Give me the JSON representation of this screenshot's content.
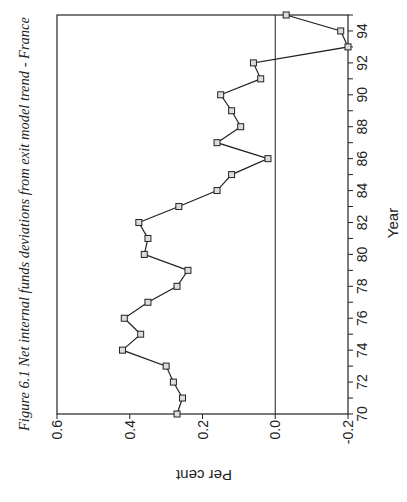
{
  "chart_data": {
    "type": "line",
    "title": "Figure 6.1 Net internal funds deviations from exit model trend - France",
    "xlabel": "Year",
    "ylabel": "Per cent",
    "orientation": "rotated 90° counter-clockwise on page",
    "x": [
      70,
      71,
      72,
      73,
      74,
      75,
      76,
      77,
      78,
      79,
      80,
      81,
      82,
      83,
      84,
      85,
      86,
      87,
      88,
      89,
      90,
      91,
      92,
      93,
      94,
      95
    ],
    "series": [
      {
        "name": "Net internal funds deviation",
        "marker": "square",
        "values": [
          0.27,
          0.255,
          0.28,
          0.3,
          0.42,
          0.37,
          0.415,
          0.35,
          0.27,
          0.24,
          0.36,
          0.35,
          0.375,
          0.265,
          0.16,
          0.12,
          0.02,
          0.16,
          0.095,
          0.12,
          0.15,
          0.04,
          0.06,
          -0.2,
          -0.18,
          -0.03
        ]
      }
    ],
    "xlim": [
      70,
      95
    ],
    "ylim": [
      -0.2,
      0.6
    ],
    "x_ticks": [
      "70",
      "72",
      "74",
      "76",
      "78",
      "80",
      "82",
      "84",
      "86",
      "88",
      "90",
      "92",
      "94"
    ],
    "y_ticks": [
      "0.6",
      "0.4",
      "0.2",
      "0.0",
      "-0.2"
    ],
    "reference_line": 0.0,
    "grid": false,
    "legend": null
  }
}
